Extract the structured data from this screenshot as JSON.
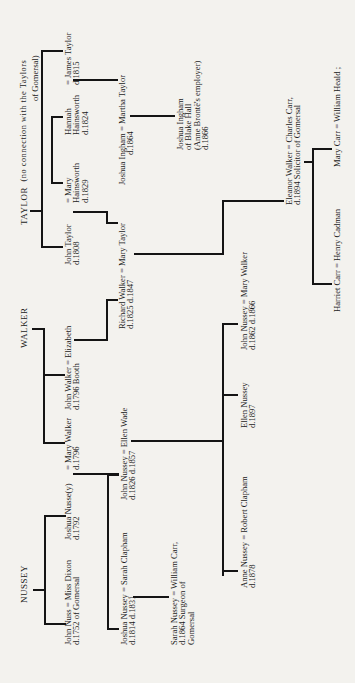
{
  "families": {
    "taylor": {
      "heading": "TAYLOR",
      "note_1": "(no connection with the Taylors",
      "note_2": "of Gomersal)"
    },
    "walker": {
      "heading": "WALKER"
    },
    "nussey": {
      "heading": "NUSSEY"
    }
  },
  "people": {
    "john_taylor": [
      "John Taylor",
      "d.1808"
    ],
    "mary_hainsworth": [
      "= Mary",
      "Hainsworth",
      "d.1829"
    ],
    "hannah_hainsworth": [
      "Hannah",
      "Hainsworth",
      "d.1824"
    ],
    "james_taylor": [
      "= James Taylor",
      "d.1815"
    ],
    "joshua_ingham": [
      "Joshua Ingham = Martha Taylor",
      "d.1864"
    ],
    "joshua_ingham_jr": [
      "Joshua Ingham",
      "of Blake Hall",
      "(Anne Brontë's employer)",
      "d.1866"
    ],
    "mary_taylor": [
      "Richard Walker = Mary Taylor",
      "d.1825                    d.1847"
    ],
    "john_walker": [
      "John Walker = Elizabeth",
      "d.1796              Booth"
    ],
    "mary_walker_1796": [
      "= Mary Walker",
      "d.1796"
    ],
    "joshua_nussey_1792": [
      "Joshua Nusse(y)",
      "d.1792"
    ],
    "john_nuss": [
      "John Nuss = Miss Dixon",
      "d.1752          of Gomersal"
    ],
    "john_nussey_1826": [
      "John Nussey = Ellen Wade",
      "d.1826                d.1857"
    ],
    "joshua_nussey_1814": [
      "Joshua Nussey = Sarah Clapham",
      "d.1814                 d.1831"
    ],
    "sarah_nussey": [
      "Sarah Nussey = William Carr,",
      "d.1864            Surgeon of",
      "                       Gomersal"
    ],
    "anne_nussey": [
      "Anne Nussey = Robert Clapham",
      "d.1878"
    ],
    "ellen_nussey": [
      "Ellen Nussey",
      "d.1897"
    ],
    "john_nussey_1862": [
      "John Nussey = Mary Walker",
      "d.1862                d.1866"
    ],
    "eleanor_walker": [
      "Eleanor  Walker = Charles Carr,",
      "d.1894        Solicitor of Gomersal"
    ],
    "harriet_carr": [
      "Harriet Carr = Henry Cadman"
    ],
    "mary_carr": [
      "Mary Carr = William Heald ;"
    ]
  }
}
